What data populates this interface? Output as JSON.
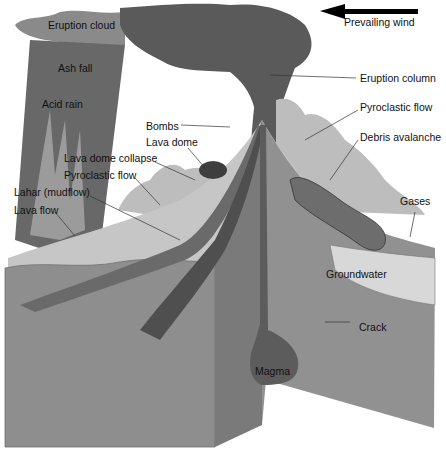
{
  "diagram": {
    "wind": {
      "label": "Prevailing wind",
      "direction": "left"
    },
    "labels": {
      "eruption_cloud": "Eruption cloud",
      "ash_fall": "Ash fall",
      "acid_rain": "Acid rain",
      "bombs": "Bombs",
      "lava_dome": "Lava dome",
      "lava_dome_collapse": "Lava dome collapse",
      "pyroclastic_flow_left": "Pyroclastic flow",
      "lahar": "Lahar (mudflow)",
      "lava_flow": "Lava flow",
      "eruption_column": "Eruption column",
      "pyroclastic_flow_right": "Pyroclastic flow",
      "debris_avalanche": "Debris avalanche",
      "gases": "Gases",
      "groundwater": "Groundwater",
      "crack": "Crack",
      "magma": "Magma"
    },
    "colors": {
      "cloud_dark": "#555555",
      "cloud_mid": "#7a7a7a",
      "ground_front": "#8f8f8f",
      "ground_side": "#7d7d7d",
      "surface_light": "#c8c8c8",
      "magma": "#5e5e5e"
    }
  }
}
